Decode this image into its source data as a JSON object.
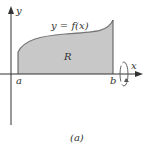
{
  "figure": {
    "y_axis_label": "y",
    "x_axis_label": "x",
    "curve_label": "y = f(x)",
    "region_label": "R",
    "left_bound": "a",
    "right_bound": "b",
    "caption": "(a)"
  },
  "colors": {
    "region_fill": "#c8c8c8",
    "curve": "#777777",
    "axis": "#333333"
  }
}
